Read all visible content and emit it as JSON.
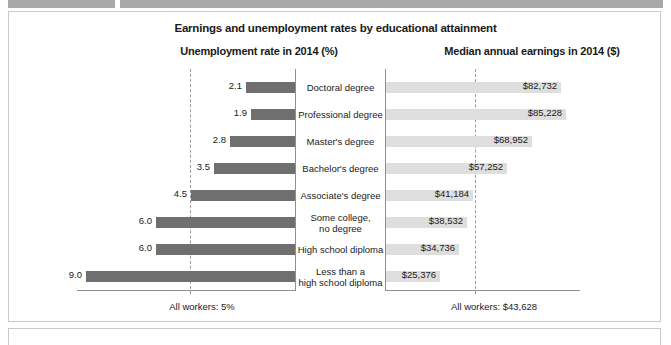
{
  "figure": {
    "title": "Earnings and unemployment rates by educational attainment",
    "left_heading": "Unemployment rate in 2014 (%)",
    "right_heading": "Median annual earnings in 2014 ($)",
    "left_footnote": "All workers: 5%",
    "right_footnote": "All workers: $43,628"
  },
  "colors": {
    "left_bar": "#6f6f6f",
    "right_bar": "#dedede",
    "axis": "#8f8f8f",
    "refline": "#9b9b9b",
    "panel_border": "#c9c9c9",
    "top_strip": "#a8a8a8",
    "text": "#1a1a1a"
  },
  "chart_data": {
    "type": "bar",
    "title": "Earnings and unemployment rates by educational attainment",
    "orientation": "horizontal",
    "layout": "paired back-to-back panels with centered category labels",
    "categories": [
      "Doctoral degree",
      "Professional degree",
      "Master's degree",
      "Bachelor's degree",
      "Associate's degree",
      "Some college,\nno degree",
      "High school diploma",
      "Less than a\nhigh school diploma"
    ],
    "category_lines": [
      [
        "Doctoral degree"
      ],
      [
        "Professional degree"
      ],
      [
        "Master's degree"
      ],
      [
        "Bachelor's degree"
      ],
      [
        "Associate's degree"
      ],
      [
        "Some college,",
        "no degree"
      ],
      [
        "High school diploma"
      ],
      [
        "Less than a",
        "high school diploma"
      ]
    ],
    "series": [
      {
        "name": "Unemployment rate in 2014 (%)",
        "panel": "left",
        "direction": "right-to-left",
        "values": [
          2.1,
          1.9,
          2.8,
          3.5,
          4.5,
          6.0,
          6.0,
          9.0
        ],
        "labels": [
          "2.1",
          "1.9",
          "2.8",
          "3.5",
          "4.5",
          "6.0",
          "6.0",
          "9.0"
        ],
        "xlim": [
          0,
          9.4
        ],
        "unit": "%",
        "reference_line": {
          "value": 5,
          "label": "All workers: 5%",
          "style": "dashed"
        }
      },
      {
        "name": "Median annual earnings in 2014 ($)",
        "panel": "right",
        "direction": "left-to-right",
        "values": [
          82732,
          85228,
          68952,
          57252,
          41184,
          38532,
          34736,
          25376
        ],
        "labels": [
          "$82,732",
          "$85,228",
          "$68,952",
          "$57,252",
          "$41,184",
          "$38,532",
          "$34,736",
          "$25,376"
        ],
        "xlim": [
          0,
          89000
        ],
        "unit": "$",
        "reference_line": {
          "value": 43628,
          "label": "All workers: $43,628",
          "style": "dashed"
        }
      }
    ],
    "grid": false,
    "legend": "none",
    "xlabel": "",
    "ylabel": ""
  }
}
